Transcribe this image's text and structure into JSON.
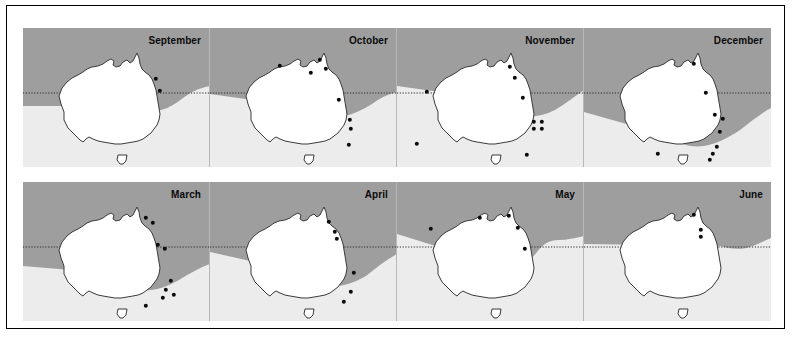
{
  "figure": {
    "type": "multi-panel-distribution-map",
    "region": "Australia",
    "panel_count": 8,
    "rows": 2,
    "columns": 4,
    "reference_line": "dotted-latitude-line",
    "colors": {
      "shade_dark": "#9e9e9e",
      "shade_light": "#ececec",
      "land_fill": "#ffffff",
      "land_stroke": "#3a3a3a",
      "dot": "#0b0b0b",
      "frame": "#000000",
      "panel_background": "#f2f2f2"
    }
  },
  "rows": [
    {
      "name": "top-row",
      "panels": [
        {
          "month": "September",
          "dot_count": 2,
          "dots": [
            {
              "x": 133,
              "y": 51
            },
            {
              "x": 137,
              "y": 63
            }
          ],
          "shade_path": "M0,0 L187,0 L187,58 C176,60 168,64 160,70 C152,76 146,80 138,82 C128,84 118,82 110,78 L0,78 Z"
        },
        {
          "month": "October",
          "dot_count": 8,
          "dots": [
            {
              "x": 70,
              "y": 38
            },
            {
              "x": 110,
              "y": 32
            },
            {
              "x": 101,
              "y": 45
            },
            {
              "x": 116,
              "y": 41
            },
            {
              "x": 129,
              "y": 72
            },
            {
              "x": 140,
              "y": 92
            },
            {
              "x": 141,
              "y": 101
            },
            {
              "x": 139,
              "y": 117
            }
          ],
          "shade_path": "M0,0 L187,0 L187,64 C178,66 170,70 162,76 C152,82 144,86 134,88 C122,90 110,86 100,80 L0,66 Z"
        },
        {
          "month": "November",
          "dot_count": 10,
          "dots": [
            {
              "x": 113,
              "y": 39
            },
            {
              "x": 118,
              "y": 50
            },
            {
              "x": 30,
              "y": 64
            },
            {
              "x": 126,
              "y": 70
            },
            {
              "x": 137,
              "y": 94
            },
            {
              "x": 145,
              "y": 94
            },
            {
              "x": 137,
              "y": 101
            },
            {
              "x": 145,
              "y": 101
            },
            {
              "x": 20,
              "y": 116
            },
            {
              "x": 130,
              "y": 127
            }
          ],
          "shade_path": "M0,0 L187,0 L187,62 C178,68 168,76 158,82 C146,88 134,90 122,88 C108,86 96,78 86,70 L0,58 Z"
        },
        {
          "month": "December",
          "dot_count": 9,
          "dots": [
            {
              "x": 110,
              "y": 36
            },
            {
              "x": 122,
              "y": 65
            },
            {
              "x": 131,
              "y": 87
            },
            {
              "x": 139,
              "y": 91
            },
            {
              "x": 136,
              "y": 104
            },
            {
              "x": 133,
              "y": 119
            },
            {
              "x": 129,
              "y": 126
            },
            {
              "x": 126,
              "y": 132
            },
            {
              "x": 74,
              "y": 126
            }
          ],
          "shade_path": "M0,0 L187,0 L187,80 C176,86 166,94 156,102 C144,110 132,116 120,118 C104,120 90,114 78,106 L0,84 Z"
        }
      ]
    },
    {
      "name": "bottom-row",
      "panels": [
        {
          "month": "March",
          "dot_count": 9,
          "dots": [
            {
              "x": 123,
              "y": 36
            },
            {
              "x": 130,
              "y": 41
            },
            {
              "x": 135,
              "y": 63
            },
            {
              "x": 142,
              "y": 67
            },
            {
              "x": 148,
              "y": 99
            },
            {
              "x": 143,
              "y": 108
            },
            {
              "x": 140,
              "y": 116
            },
            {
              "x": 151,
              "y": 113
            },
            {
              "x": 123,
              "y": 124
            }
          ],
          "shade_path": "M0,0 L187,0 L187,82 C176,86 166,92 156,98 C142,106 128,110 114,108 C98,106 84,98 72,90 L0,84 Z"
        },
        {
          "month": "April",
          "dot_count": 6,
          "dots": [
            {
              "x": 119,
              "y": 40
            },
            {
              "x": 125,
              "y": 50
            },
            {
              "x": 127,
              "y": 57
            },
            {
              "x": 144,
              "y": 91
            },
            {
              "x": 141,
              "y": 110
            },
            {
              "x": 134,
              "y": 120
            }
          ],
          "shade_path": "M0,0 L187,0 L187,72 C176,78 166,86 156,94 C142,102 128,106 114,104 C98,102 84,94 72,86 L0,70 Z"
        },
        {
          "month": "May",
          "dot_count": 5,
          "dots": [
            {
              "x": 83,
              "y": 36
            },
            {
              "x": 112,
              "y": 34
            },
            {
              "x": 121,
              "y": 46
            },
            {
              "x": 34,
              "y": 47
            },
            {
              "x": 128,
              "y": 67
            }
          ],
          "shade_path": "M0,0 L187,0 L187,54 C178,56 170,58 162,58 C152,58 146,62 140,70 C132,80 124,88 114,90 C102,92 92,86 84,78 L0,52 Z"
        },
        {
          "month": "June",
          "dot_count": 3,
          "dots": [
            {
              "x": 110,
              "y": 33
            },
            {
              "x": 117,
              "y": 48
            },
            {
              "x": 117,
              "y": 55
            }
          ],
          "shade_path": "M0,0 L187,0 L187,56 C178,60 170,64 162,66 C152,68 144,66 136,64 L0,62 Z"
        }
      ]
    }
  ]
}
